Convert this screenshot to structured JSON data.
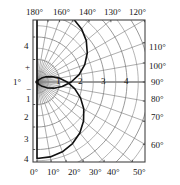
{
  "figure": {
    "kind": "polar-radiation-pattern",
    "background": "#ffffff",
    "frame_color": "#444444",
    "grid_color": "#777777",
    "curve_color": "#111111",
    "axis_color": "#888888"
  },
  "axes": {
    "top_ticks": [
      {
        "label": "180°"
      },
      {
        "label": "160°"
      },
      {
        "label": "140°"
      },
      {
        "label": "130°"
      },
      {
        "label": "120°"
      }
    ],
    "right_ticks": [
      {
        "label": "110°"
      },
      {
        "label": "100°"
      },
      {
        "label": "90°"
      },
      {
        "label": "80°"
      },
      {
        "label": "70°"
      },
      {
        "label": "60°"
      }
    ],
    "bottom_ticks": [
      {
        "label": "0°"
      },
      {
        "label": "10°"
      },
      {
        "label": "20°"
      },
      {
        "label": "30°"
      },
      {
        "label": "40°"
      },
      {
        "label": "50°"
      }
    ],
    "left_ticks": [
      {
        "label": "4"
      },
      {
        "label": "+"
      },
      {
        "label": "1°"
      },
      {
        "label": "−"
      },
      {
        "label": "1"
      },
      {
        "label": "2"
      },
      {
        "label": "3"
      },
      {
        "label": "4"
      }
    ],
    "radial_labels": [
      {
        "label": "1"
      },
      {
        "label": "2"
      },
      {
        "label": "3"
      },
      {
        "label": "4"
      }
    ]
  },
  "chart_data": {
    "type": "line",
    "title": "",
    "subtitle": "",
    "xlabel": "",
    "ylabel": "",
    "coordinate_system": "polar",
    "grid": true,
    "legend": null,
    "angle_unit": "degrees",
    "angle_ticks_deg": [
      0,
      10,
      20,
      30,
      40,
      50,
      60,
      70,
      80,
      90,
      100,
      110,
      120,
      130,
      140,
      160,
      180
    ],
    "radial_ticks": [
      1,
      2,
      3,
      4
    ],
    "rlim": [
      0,
      4
    ],
    "pole_position_px": {
      "x": 37,
      "y": 82
    },
    "radial_scale_px_per_unit": 22.5,
    "series": [
      {
        "name": "pattern",
        "closed": true,
        "points_polar": [
          {
            "theta_deg": 0,
            "r": 3.4
          },
          {
            "theta_deg": 10,
            "r": 3.38
          },
          {
            "theta_deg": 20,
            "r": 3.3
          },
          {
            "theta_deg": 30,
            "r": 3.16
          },
          {
            "theta_deg": 40,
            "r": 2.96
          },
          {
            "theta_deg": 50,
            "r": 2.7
          },
          {
            "theta_deg": 60,
            "r": 2.4
          },
          {
            "theta_deg": 70,
            "r": 2.06
          },
          {
            "theta_deg": 80,
            "r": 1.7
          },
          {
            "theta_deg": 90,
            "r": 1.34
          },
          {
            "theta_deg": 100,
            "r": 1.0
          },
          {
            "theta_deg": 110,
            "r": 0.7
          },
          {
            "theta_deg": 120,
            "r": 0.46
          },
          {
            "theta_deg": 130,
            "r": 0.27
          },
          {
            "theta_deg": 140,
            "r": 0.14
          },
          {
            "theta_deg": 150,
            "r": 0.06
          },
          {
            "theta_deg": 160,
            "r": 0.02
          },
          {
            "theta_deg": 170,
            "r": 0.0
          },
          {
            "theta_deg": 180,
            "r": 0.0
          },
          {
            "theta_deg": 190,
            "r": 0.0
          },
          {
            "theta_deg": 200,
            "r": 0.02
          },
          {
            "theta_deg": 210,
            "r": 0.06
          },
          {
            "theta_deg": 220,
            "r": 0.15
          },
          {
            "theta_deg": 230,
            "r": 0.3
          },
          {
            "theta_deg": 240,
            "r": 0.52
          },
          {
            "theta_deg": 250,
            "r": 0.8
          },
          {
            "theta_deg": 260,
            "r": 1.14
          },
          {
            "theta_deg": 270,
            "r": 1.52
          },
          {
            "theta_deg": 280,
            "r": 1.9
          },
          {
            "theta_deg": 290,
            "r": 2.26
          },
          {
            "theta_deg": 300,
            "r": 2.58
          },
          {
            "theta_deg": 310,
            "r": 2.86
          },
          {
            "theta_deg": 320,
            "r": 3.08
          },
          {
            "theta_deg": 330,
            "r": 3.24
          },
          {
            "theta_deg": 340,
            "r": 3.34
          },
          {
            "theta_deg": 350,
            "r": 3.39
          },
          {
            "theta_deg": 360,
            "r": 3.4
          }
        ]
      }
    ]
  }
}
